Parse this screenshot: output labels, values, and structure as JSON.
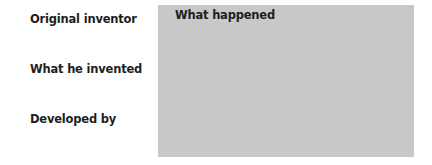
{
  "labels": {
    "original_inventor": "Original inventor",
    "what_he_invented": "What he invented",
    "developed_by": "Developed by"
  },
  "box": {
    "title": "What happened"
  }
}
